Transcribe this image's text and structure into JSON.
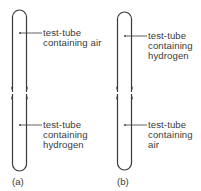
{
  "diagram": {
    "stroke_color": "#3a3a3a",
    "panels": [
      {
        "caption": "(a)",
        "top_label": [
          "test-tube",
          "containing air"
        ],
        "bottom_label": [
          "test-tube",
          "containing",
          "hydrogen"
        ]
      },
      {
        "caption": "(b)",
        "top_label": [
          "test-tube",
          "containing",
          "hydrogen"
        ],
        "bottom_label": [
          "test-tube",
          "containing",
          "air"
        ]
      }
    ]
  }
}
